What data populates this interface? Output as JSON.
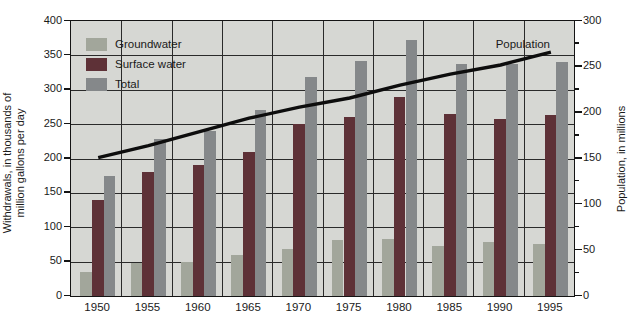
{
  "chart_data": {
    "type": "bar",
    "title": "",
    "categories": [
      "1950",
      "1955",
      "1960",
      "1965",
      "1970",
      "1975",
      "1980",
      "1985",
      "1990",
      "1995"
    ],
    "series": [
      {
        "name": "Groundwater",
        "type": "bar",
        "color": "#a2a69b",
        "values": [
          35,
          48,
          50,
          60,
          68,
          82,
          83,
          73,
          79,
          76
        ]
      },
      {
        "name": "Surface water",
        "type": "bar",
        "color": "#5e3137",
        "values": [
          140,
          180,
          190,
          210,
          250,
          260,
          290,
          265,
          258,
          264
        ]
      },
      {
        "name": "Total",
        "type": "bar",
        "color": "#85888a",
        "values": [
          175,
          228,
          240,
          270,
          318,
          342,
          373,
          338,
          337,
          340
        ]
      }
    ],
    "line_series": {
      "name": "Population",
      "label": "Population",
      "axis": "right",
      "color": "#0d0d0d",
      "values": [
        151,
        164,
        179,
        194,
        206,
        216,
        230,
        242,
        252,
        266
      ]
    },
    "left_axis": {
      "label": "Withdrawals, in thousands of million gallons per day",
      "label_lines": [
        "Withdrawals, in thousands of",
        "million gallons per day"
      ],
      "min": 0,
      "max": 400,
      "tick_step": 50,
      "ticks": [
        400,
        350,
        300,
        250,
        200,
        150,
        100,
        50,
        0
      ]
    },
    "right_axis": {
      "label": "Population, in millions",
      "min": 0,
      "max": 300,
      "tick_step": 50,
      "minor_tick_step": 25,
      "ticks": [
        300,
        250,
        200,
        150,
        100,
        50,
        0
      ]
    },
    "legend": [
      "Groundwater",
      "Surface water",
      "Total"
    ],
    "legend_position": "top-left-inside",
    "grid": "on",
    "plot_bg": "#d6d7d3",
    "border_color": "#141414"
  }
}
